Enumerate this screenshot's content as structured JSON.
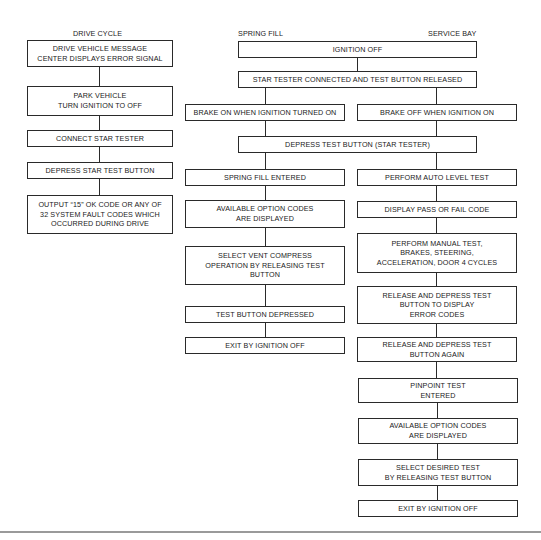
{
  "columns": {
    "drive_cycle": "DRIVE CYCLE",
    "spring_fill": "SPRING FILL",
    "service_bay": "SERVICE BAY"
  },
  "drive_cycle": [
    "DRIVE VEHICLE MESSAGE\nCENTER DISPLAYS ERROR SIGNAL",
    "PARK VEHICLE\nTURN IGNITION TO OFF",
    "CONNECT STAR TESTER",
    "DEPRESS STAR TEST BUTTON",
    "OUTPUT “15” OK CODE OR ANY OF\n32 SYSTEM FAULT CODES WHICH\nOCCURRED DURING DRIVE"
  ],
  "shared": {
    "ignition_off": "IGNITION OFF",
    "star_tester": "STAR TESTER CONNECTED AND TEST BUTTON RELEASED",
    "depress_test": "DEPRESS TEST BUTTON (STAR TESTER)"
  },
  "spring_fill": {
    "brake_on": "BRAKE ON WHEN IGNITION TURNED ON",
    "steps": [
      "SPRING FILL ENTERED",
      "AVAILABLE OPTION CODES\nARE DISPLAYED",
      "SELECT VENT COMPRESS\nOPERATION BY RELEASING TEST\nBUTTON",
      "TEST BUTTON DEPRESSED",
      "EXIT BY IGNITION OFF"
    ]
  },
  "service_bay": {
    "brake_off": "BRAKE OFF WHEN IGNITION ON",
    "steps": [
      "PERFORM AUTO LEVEL TEST",
      "DISPLAY PASS OR FAIL CODE",
      "PERFORM MANUAL TEST,\nBRAKES, STEERING,\nACCELERATION, DOOR 4 CYCLES",
      "RELEASE AND DEPRESS TEST\nBUTTON TO DISPLAY\nERROR CODES",
      "RELEASE AND DEPRESS TEST\nBUTTON AGAIN",
      "PINPOINT TEST\nENTERED",
      "AVAILABLE OPTION CODES\nARE DISPLAYED",
      "SELECT DESIRED TEST\nBY RELEASING TEST BUTTON",
      "EXIT BY IGNITION OFF"
    ]
  }
}
